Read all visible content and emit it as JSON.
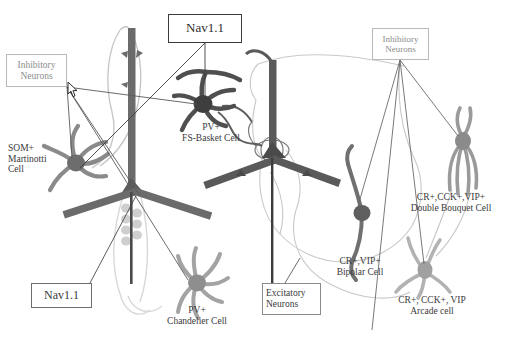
{
  "figure": {
    "title_present": false,
    "background_color": "#ffffff",
    "text_color": "#3a3a3a"
  },
  "boxes": [
    {
      "id": "inhibitory-neurons-left",
      "lines": [
        "Inhibitory",
        "Neurons"
      ],
      "line1": "Inhibitory",
      "line2": "Neurons",
      "x": 6,
      "y": 54,
      "w": 61,
      "h": 33,
      "border_color": "#b9b9b9",
      "text_color": "#8d8d8d",
      "font_size": 9.5,
      "align": "center"
    },
    {
      "id": "nav11-top",
      "lines": [
        "Nav1.1"
      ],
      "line1": "Nav1.1",
      "x": 168,
      "y": 14,
      "w": 74,
      "h": 29,
      "border_color": "#3b3b3b",
      "text_color": "#2e2e2e",
      "font_size": 13,
      "align": "center"
    },
    {
      "id": "inhibitory-neurons-right",
      "lines": [
        "Inhibitory",
        "Neurons"
      ],
      "line1": "Inhibitory",
      "line2": "Neurons",
      "x": 372,
      "y": 28,
      "w": 57,
      "h": 32,
      "border_color": "#b9b9b9",
      "text_color": "#8d8d8d",
      "font_size": 9,
      "align": "center"
    },
    {
      "id": "nav11-bottom",
      "lines": [
        "Nav1.1"
      ],
      "line1": "Nav1.1",
      "x": 31,
      "y": 283,
      "w": 61,
      "h": 25,
      "border_color": "#6e6e6e",
      "text_color": "#3a3a3a",
      "font_size": 12,
      "align": "center"
    },
    {
      "id": "excitatory-neurons",
      "lines": [
        "Excitatory",
        "Neurons"
      ],
      "line1": "Excitatory",
      "line2": "Neurons",
      "x": 262,
      "y": 283,
      "w": 59,
      "h": 32,
      "border_color": "#8a8a8a",
      "text_color": "#3a3a3a",
      "font_size": 9.5,
      "align": "left"
    }
  ],
  "cell_labels": [
    {
      "id": "som-martinotti",
      "line1": "SOM+",
      "line2": "Martinotti",
      "line3": "Cell",
      "x": 8,
      "y": 143,
      "font_size": 9.5,
      "align": "left",
      "color": "#3a3a3a"
    },
    {
      "id": "pv-fs-basket",
      "line1": "PV+",
      "line2": "FS-Basket Cell",
      "x": 168,
      "y": 122,
      "font_size": 9.5,
      "align": "center",
      "color": "#3a3a3a"
    },
    {
      "id": "pv-chandelier",
      "line1": "PV+",
      "line2": "Chandelier Cell",
      "x": 152,
      "y": 305,
      "font_size": 9.5,
      "align": "center",
      "color": "#3a3a3a"
    },
    {
      "id": "cr-vip-bipolar",
      "line1": "CR+,VIP+",
      "line2": "Bipolar Cell",
      "x": 323,
      "y": 256,
      "font_size": 9.5,
      "align": "center",
      "color": "#3a3a3a"
    },
    {
      "id": "cr-cck-vip-double-bouquet",
      "line1": "CR+,CCK+,VIP+",
      "line2": "Double Bouquet Cell",
      "x": 404,
      "y": 192,
      "font_size": 9.5,
      "align": "center",
      "color": "#3a3a3a"
    },
    {
      "id": "cr-cck-vip-arcade",
      "line1": "CR+, CCK+, VIP",
      "line2": "Arcade cell",
      "x": 382,
      "y": 295,
      "font_size": 9.5,
      "align": "center",
      "color": "#3a3a3a"
    }
  ],
  "neurons": [
    {
      "id": "pyramidal-cell-left",
      "type": "excitatory-pyramidal",
      "color": "#5c5c5c",
      "soma_x": 132,
      "soma_y": 188
    },
    {
      "id": "pyramidal-cell-right",
      "type": "excitatory-pyramidal",
      "color": "#4a4a4a",
      "soma_x": 272,
      "soma_y": 152
    },
    {
      "id": "martinotti-cell",
      "type": "inhibitory-interneuron",
      "color": "#8a8a8a",
      "soma_x": 76,
      "soma_y": 163
    },
    {
      "id": "fs-basket-cell",
      "type": "inhibitory-interneuron",
      "color": "#4f4f4f",
      "soma_x": 203,
      "soma_y": 104
    },
    {
      "id": "chandelier-cell",
      "type": "inhibitory-interneuron",
      "color": "#9d9d9d",
      "soma_x": 197,
      "soma_y": 283
    },
    {
      "id": "bipolar-cell",
      "type": "inhibitory-interneuron",
      "color": "#6f6f6f",
      "soma_x": 362,
      "soma_y": 213
    },
    {
      "id": "double-bouquet-cell",
      "type": "inhibitory-interneuron",
      "color": "#9a9a9a",
      "soma_x": 463,
      "soma_y": 146
    },
    {
      "id": "arcade-cell",
      "type": "inhibitory-interneuron",
      "color": "#b0b0b0",
      "soma_x": 425,
      "soma_y": 272
    }
  ],
  "connectors": {
    "stroke_color_dark": "#4a4a4a",
    "stroke_color_light": "#9a9a9a",
    "inhibitory_left_origin": {
      "x": 67,
      "y": 87
    },
    "inhibitory_right_origin": {
      "x": 400,
      "y": 60
    },
    "nav11_top_origin": {
      "x": 205,
      "y": 43
    },
    "nav11_bottom_origin": {
      "x": 90,
      "y": 283
    },
    "excitatory_origin": {
      "x": 285,
      "y": 283
    }
  },
  "cursor": {
    "id": "mouse-pointer",
    "x": 69,
    "y": 84,
    "visible": true
  }
}
